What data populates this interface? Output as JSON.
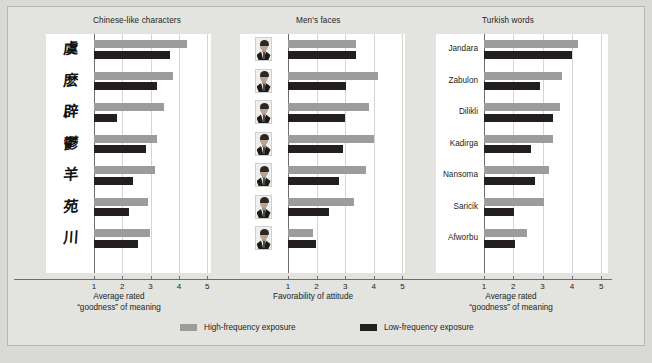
{
  "chart_data": {
    "type": "bar",
    "title": "",
    "orientation": "horizontal",
    "legend": {
      "position": "bottom",
      "entries": [
        {
          "label": "High-frequency exposure",
          "color": "#9c9c9c",
          "key": "high"
        },
        {
          "label": "Low-frequency exposure",
          "color": "#231f20",
          "key": "low"
        }
      ]
    },
    "xlim": [
      1,
      5
    ],
    "xticks": [
      1,
      2,
      3,
      4,
      5
    ],
    "grid": true,
    "panels": [
      {
        "title": "Chinese-like characters",
        "xlabel_line1": "Average rated",
        "xlabel_line2": "“goodness” of meaning",
        "category_type": "glyph",
        "categories": [
          "虞",
          "麽",
          "辟",
          "鬱",
          "羊",
          "苑",
          "川"
        ],
        "series": [
          {
            "name": "High-frequency exposure",
            "values": [
              4.28,
              3.78,
              3.47,
              3.22,
              3.15,
              2.91,
              2.98
            ]
          },
          {
            "name": "Low-frequency exposure",
            "values": [
              3.69,
              3.24,
              1.8,
              2.83,
              2.38,
              2.22,
              2.57
            ]
          }
        ]
      },
      {
        "title": "Men's faces",
        "xlabel_line1": "Favorability of attitude",
        "xlabel_line2": "",
        "category_type": "face",
        "categories": [
          "face-1",
          "face-2",
          "face-3",
          "face-4",
          "face-5",
          "face-6",
          "face-7"
        ],
        "series": [
          {
            "name": "High-frequency exposure",
            "values": [
              3.38,
              4.13,
              3.82,
              4.02,
              3.72,
              3.32,
              1.88
            ]
          },
          {
            "name": "Low-frequency exposure",
            "values": [
              3.38,
              3.02,
              3.0,
              2.93,
              2.79,
              2.44,
              1.97
            ]
          }
        ]
      },
      {
        "title": "Turkish words",
        "xlabel_line1": "Average rated",
        "xlabel_line2": "“goodness” of meaning",
        "category_type": "text",
        "categories": [
          "Jandara",
          "Zabulon",
          "Dilikli",
          "Kadirga",
          "Nansoma",
          "Saricik",
          "Afworbu"
        ],
        "series": [
          {
            "name": "High-frequency exposure",
            "values": [
              4.22,
              3.66,
              3.6,
              3.36,
              3.22,
              3.05,
              2.48
            ]
          },
          {
            "name": "Low-frequency exposure",
            "values": [
              3.99,
              2.92,
              3.36,
              2.6,
              2.75,
              2.02,
              2.05
            ]
          }
        ]
      }
    ]
  },
  "colors": {
    "high_frequency": "#9c9c9c",
    "low_frequency": "#231f20",
    "background": "#d9d9d6",
    "plot_background": "#ffffff",
    "axis": "#6e6e6b",
    "gridline": "#d5d5d2"
  }
}
